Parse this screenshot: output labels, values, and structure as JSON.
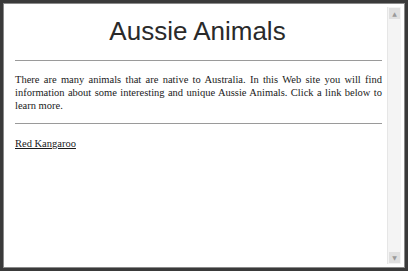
{
  "page": {
    "title": "Aussie Animals",
    "intro": "There are many animals that are native to Australia. In this Web site you will find information about some interesting and unique Aussie Animals. Click a link below to learn more.",
    "links": [
      {
        "label": "Red Kangaroo"
      }
    ]
  },
  "scrollbar": {
    "up_icon": "▲",
    "down_icon": "▼"
  }
}
